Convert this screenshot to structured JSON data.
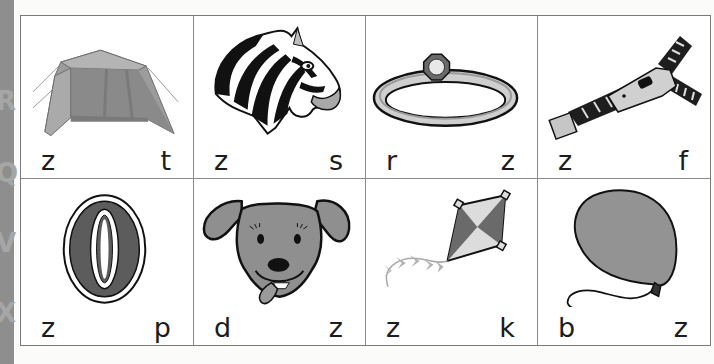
{
  "worksheet": {
    "cards": [
      {
        "picture": "tent",
        "icon": "tent-icon",
        "left_letter": "z",
        "right_letter": "t"
      },
      {
        "picture": "zebra",
        "icon": "zebra-icon",
        "left_letter": "z",
        "right_letter": "s"
      },
      {
        "picture": "ring",
        "icon": "ring-icon",
        "left_letter": "r",
        "right_letter": "z"
      },
      {
        "picture": "zipper",
        "icon": "zipper-icon",
        "left_letter": "z",
        "right_letter": "f"
      },
      {
        "picture": "zero",
        "icon": "zero-icon",
        "left_letter": "z",
        "right_letter": "p"
      },
      {
        "picture": "dog",
        "icon": "dog-icon",
        "left_letter": "d",
        "right_letter": "z"
      },
      {
        "picture": "kite",
        "icon": "kite-icon",
        "left_letter": "z",
        "right_letter": "k"
      },
      {
        "picture": "balloon",
        "icon": "balloon-icon",
        "left_letter": "b",
        "right_letter": "z"
      }
    ],
    "side_strip_letters": [
      "R",
      "Q",
      "V",
      "X"
    ]
  },
  "colors": {
    "border": "#7a7a7a",
    "strip": "#8e8e8e",
    "fill_gray": "#8f8f8f",
    "text": "#1c1c1c"
  }
}
